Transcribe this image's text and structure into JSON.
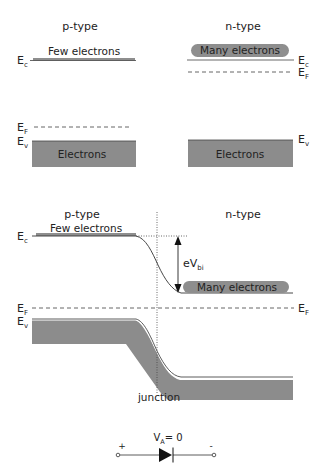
{
  "top_section": {
    "p_type": {
      "title": "p-type",
      "conduction_label": "Few electrons",
      "ec_label": "E",
      "ec_sub": "c",
      "ef_label": "E",
      "ef_sub": "F",
      "ev_label": "E",
      "ev_sub": "v",
      "valence_label": "Electrons"
    },
    "n_type": {
      "title": "n-type",
      "conduction_label": "Many electrons",
      "ec_label": "E",
      "ec_sub": "c",
      "ef_label": "E",
      "ef_sub": "F",
      "ev_label": "E",
      "ev_sub": "v",
      "valence_label": "Electrons"
    }
  },
  "junction_section": {
    "p_title": "p-type",
    "n_title": "n-type",
    "p_conduction_label": "Few electrons",
    "n_conduction_label": "Many electrons",
    "ec_label": "E",
    "ec_sub": "c",
    "ef_left_label": "E",
    "ef_left_sub": "F",
    "ef_right_label": "E",
    "ef_right_sub": "F",
    "ev_label": "E",
    "ev_sub": "v",
    "barrier_label": "eV",
    "barrier_sub": "bi",
    "junction_label": "junction"
  },
  "diode": {
    "voltage_label": "V",
    "voltage_sub": "A",
    "voltage_value": "= 0",
    "plus": "+",
    "minus": "-"
  },
  "colors": {
    "band_fill": "#8c8c8c",
    "pill_fill": "#8e8e8e",
    "line": "#333333",
    "dash": "#555555"
  }
}
